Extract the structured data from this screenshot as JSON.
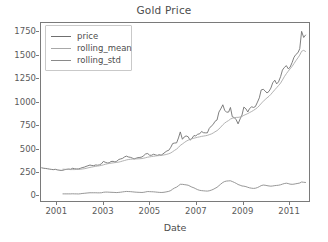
{
  "chart_data": {
    "type": "line",
    "title": "Gold Price",
    "xlabel": "Date",
    "ylabel": "",
    "grid": false,
    "legend_position": "upper left",
    "xlim": [
      2000.3,
      2011.9
    ],
    "ylim": [
      -70,
      1850
    ],
    "xticks": [
      "2001",
      "2003",
      "2005",
      "2007",
      "2009",
      "2011"
    ],
    "xtick_values": [
      2001,
      2003,
      2005,
      2007,
      2009,
      2011
    ],
    "yticks": [
      "0",
      "250",
      "500",
      "750",
      "1000",
      "1250",
      "1500",
      "1750"
    ],
    "ytick_values": [
      0,
      250,
      500,
      750,
      1000,
      1250,
      1500,
      1750
    ],
    "colors": {
      "price": "#6f6f6f",
      "rolling_mean": "#a8a8a8",
      "rolling_std": "#8a8a8a",
      "axis": "#7a7a7a",
      "text": "#4d4d4d"
    },
    "x": [
      2000.33,
      2000.42,
      2000.5,
      2000.58,
      2000.67,
      2000.75,
      2000.83,
      2000.92,
      2001.0,
      2001.08,
      2001.17,
      2001.25,
      2001.33,
      2001.42,
      2001.5,
      2001.58,
      2001.67,
      2001.75,
      2001.83,
      2001.92,
      2002.0,
      2002.08,
      2002.17,
      2002.25,
      2002.33,
      2002.42,
      2002.5,
      2002.58,
      2002.67,
      2002.75,
      2002.83,
      2002.92,
      2003.0,
      2003.08,
      2003.17,
      2003.25,
      2003.33,
      2003.42,
      2003.5,
      2003.58,
      2003.67,
      2003.75,
      2003.83,
      2003.92,
      2004.0,
      2004.08,
      2004.17,
      2004.25,
      2004.33,
      2004.42,
      2004.5,
      2004.58,
      2004.67,
      2004.75,
      2004.83,
      2004.92,
      2005.0,
      2005.08,
      2005.17,
      2005.25,
      2005.33,
      2005.42,
      2005.5,
      2005.58,
      2005.67,
      2005.75,
      2005.83,
      2005.92,
      2006.0,
      2006.08,
      2006.17,
      2006.25,
      2006.33,
      2006.42,
      2006.5,
      2006.58,
      2006.67,
      2006.75,
      2006.83,
      2006.92,
      2007.0,
      2007.08,
      2007.17,
      2007.25,
      2007.33,
      2007.42,
      2007.5,
      2007.58,
      2007.67,
      2007.75,
      2007.83,
      2007.92,
      2008.0,
      2008.08,
      2008.17,
      2008.25,
      2008.33,
      2008.42,
      2008.5,
      2008.58,
      2008.67,
      2008.75,
      2008.83,
      2008.92,
      2009.0,
      2009.08,
      2009.17,
      2009.25,
      2009.33,
      2009.42,
      2009.5,
      2009.58,
      2009.67,
      2009.75,
      2009.83,
      2009.92,
      2010.0,
      2010.08,
      2010.17,
      2010.25,
      2010.33,
      2010.42,
      2010.5,
      2010.58,
      2010.67,
      2010.75,
      2010.83,
      2010.92,
      2011.0,
      2011.08,
      2011.17,
      2011.25,
      2011.33,
      2011.42,
      2011.5,
      2011.58,
      2011.67,
      2011.75
    ],
    "series": [
      {
        "name": "price",
        "values": [
          288,
          283,
          281,
          278,
          274,
          271,
          268,
          272,
          266,
          263,
          260,
          262,
          268,
          272,
          275,
          272,
          283,
          278,
          276,
          276,
          282,
          290,
          295,
          303,
          310,
          318,
          313,
          311,
          319,
          316,
          320,
          332,
          357,
          348,
          340,
          342,
          356,
          358,
          351,
          359,
          378,
          384,
          390,
          406,
          414,
          405,
          401,
          393,
          384,
          392,
          398,
          400,
          405,
          420,
          438,
          442,
          424,
          423,
          434,
          428,
          422,
          430,
          424,
          438,
          456,
          470,
          477,
          510,
          550,
          555,
          557,
          610,
          675,
          596,
          621,
          632,
          623,
          586,
          605,
          636,
          632,
          650,
          655,
          680,
          667,
          665,
          665,
          712,
          738,
          755,
          789,
          804,
          889,
          923,
          968,
          909,
          888,
          889,
          939,
          839,
          829,
          806,
          762,
          816,
          858,
          943,
          924,
          890,
          928,
          946,
          939,
          949,
          997,
          1043,
          1128,
          1135,
          1117,
          1095,
          1113,
          1148,
          1205,
          1233,
          1193,
          1215,
          1271,
          1342,
          1370,
          1390,
          1356,
          1372,
          1424,
          1480,
          1510,
          1529,
          1573,
          1760,
          1694,
          1720
        ]
      },
      {
        "name": "rolling_mean",
        "values": [
          null,
          null,
          null,
          null,
          null,
          null,
          null,
          null,
          null,
          null,
          null,
          273,
          272,
          271,
          270,
          269,
          269,
          269,
          270,
          270,
          272,
          275,
          278,
          282,
          287,
          292,
          296,
          300,
          304,
          307,
          310,
          314,
          320,
          326,
          331,
          335,
          338,
          341,
          344,
          346,
          350,
          355,
          361,
          367,
          373,
          377,
          380,
          382,
          383,
          384,
          385,
          386,
          388,
          392,
          397,
          403,
          406,
          409,
          412,
          415,
          418,
          420,
          422,
          425,
          429,
          434,
          440,
          449,
          462,
          476,
          490,
          508,
          530,
          545,
          560,
          574,
          586,
          594,
          601,
          608,
          612,
          618,
          622,
          627,
          630,
          634,
          638,
          645,
          653,
          663,
          676,
          689,
          706,
          727,
          752,
          770,
          785,
          798,
          814,
          822,
          828,
          832,
          832,
          836,
          842,
          854,
          864,
          873,
          884,
          896,
          908,
          921,
          938,
          958,
          983,
          1005,
          1024,
          1042,
          1060,
          1080,
          1104,
          1130,
          1152,
          1175,
          1202,
          1235,
          1270,
          1303,
          1330,
          1355,
          1382,
          1412,
          1443,
          1474,
          1504,
          1545,
          1555,
          1543
        ]
      },
      {
        "name": "rolling_std",
        "values": [
          null,
          null,
          null,
          null,
          null,
          null,
          null,
          null,
          null,
          null,
          null,
          7,
          7,
          7,
          7,
          7,
          8,
          7,
          7,
          6,
          8,
          11,
          13,
          15,
          17,
          19,
          19,
          19,
          19,
          18,
          18,
          19,
          24,
          26,
          26,
          25,
          24,
          23,
          22,
          21,
          23,
          25,
          28,
          31,
          33,
          32,
          31,
          29,
          27,
          25,
          24,
          23,
          22,
          24,
          28,
          32,
          31,
          30,
          29,
          27,
          25,
          23,
          22,
          23,
          26,
          30,
          34,
          43,
          58,
          70,
          80,
          95,
          110,
          110,
          107,
          104,
          100,
          90,
          80,
          72,
          62,
          52,
          45,
          42,
          40,
          38,
          37,
          40,
          47,
          55,
          66,
          78,
          95,
          112,
          130,
          140,
          145,
          147,
          148,
          140,
          130,
          120,
          108,
          100,
          92,
          90,
          85,
          78,
          72,
          68,
          66,
          68,
          75,
          85,
          96,
          102,
          100,
          96,
          92,
          90,
          92,
          96,
          98,
          100,
          105,
          112,
          118,
          122,
          118,
          112,
          110,
          112,
          116,
          120,
          124,
          135,
          132,
          130
        ]
      }
    ]
  },
  "legend": {
    "items": [
      {
        "label": "price"
      },
      {
        "label": "rolling_mean"
      },
      {
        "label": "rolling_std"
      }
    ]
  }
}
